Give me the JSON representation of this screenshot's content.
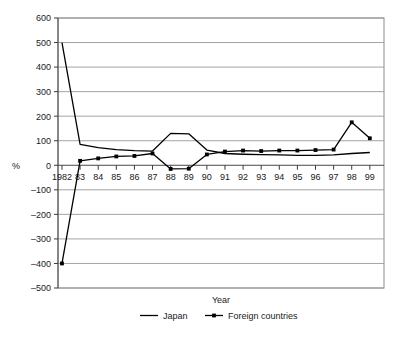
{
  "chart_data": {
    "type": "line",
    "title": "",
    "xlabel": "Year",
    "ylabel": "%",
    "ylim": [
      -500,
      600
    ],
    "ytick_step": 100,
    "grid": true,
    "legend_position": "bottom",
    "categories": [
      "1982",
      "83",
      "84",
      "85",
      "86",
      "87",
      "88",
      "89",
      "90",
      "91",
      "92",
      "93",
      "94",
      "95",
      "96",
      "97",
      "98",
      "99"
    ],
    "yticks": [
      "600",
      "500",
      "400",
      "300",
      "200",
      "100",
      "0",
      "–100",
      "–200",
      "–300",
      "–400",
      "–500"
    ],
    "ytick_values": [
      600,
      500,
      400,
      300,
      200,
      100,
      0,
      -100,
      -200,
      -300,
      -400,
      -500
    ],
    "series": [
      {
        "name": "Japan",
        "marker": "none",
        "color": "#000000",
        "values": [
          500,
          85,
          72,
          64,
          60,
          58,
          130,
          128,
          62,
          48,
          45,
          43,
          42,
          40,
          40,
          42,
          48,
          52
        ]
      },
      {
        "name": "Foreign countries",
        "marker": "square",
        "color": "#000000",
        "values": [
          -400,
          18,
          28,
          36,
          38,
          48,
          -15,
          -14,
          44,
          56,
          60,
          58,
          60,
          60,
          62,
          64,
          175,
          110
        ]
      }
    ]
  },
  "legend": {
    "items": [
      {
        "label": "Japan",
        "marker": "none"
      },
      {
        "label": "Foreign countries",
        "marker": "square"
      }
    ]
  },
  "axes": {
    "x_title": "Year",
    "y_unit": "%"
  }
}
